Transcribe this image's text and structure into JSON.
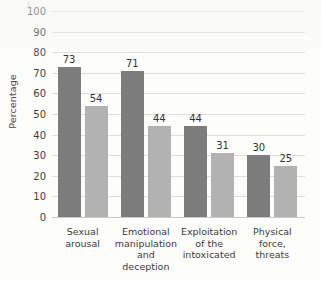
{
  "chart_data": {
    "type": "bar",
    "title": "",
    "xlabel": "",
    "ylabel": "Percentage",
    "ylim": [
      0,
      100
    ],
    "ytick_step": 10,
    "yticks": [
      "100",
      "90",
      "80",
      "70",
      "60",
      "50",
      "40",
      "30",
      "20",
      "10",
      "0"
    ],
    "grid": true,
    "legend": "none",
    "categories": [
      "Sexual arousal",
      "Emotional manipulation and deception",
      "Exploitation of the intoxicated",
      "Physical force, threats"
    ],
    "category_lines": [
      [
        "Sexual",
        "arousal"
      ],
      [
        "Emotional",
        "manipulation",
        "and",
        "deception"
      ],
      [
        "Exploitation",
        "of the",
        "intoxicated"
      ],
      [
        "Physical",
        "force,",
        "threats"
      ]
    ],
    "series": [
      {
        "name": "series-1",
        "color": "#7c7c7c",
        "values": [
          73,
          71,
          44,
          30
        ]
      },
      {
        "name": "series-2",
        "color": "#b2b2b2",
        "values": [
          54,
          44,
          31,
          25
        ]
      }
    ],
    "value_labels": [
      "73",
      "54",
      "71",
      "44",
      "44",
      "31",
      "30",
      "25"
    ]
  },
  "colors": {
    "series_dark": "#7c7c7c",
    "series_light": "#b2b2b2",
    "gridline": "#dedede",
    "axis": "#c9c9c9",
    "background": "#fdfdfc",
    "text": "#3b3b3b"
  }
}
